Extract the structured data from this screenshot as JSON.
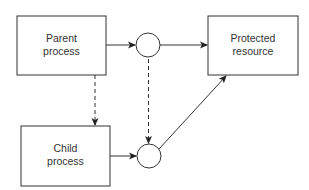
{
  "diagram": {
    "nodes": {
      "parent": {
        "line1": "Parent",
        "line2": "process"
      },
      "child": {
        "line1": "Child",
        "line2": "process"
      },
      "resource": {
        "line1": "Protected",
        "line2": "resource"
      }
    },
    "connectors": [
      {
        "from": "parent",
        "to": "circle-top",
        "style": "solid"
      },
      {
        "from": "circle-top",
        "to": "resource",
        "style": "solid"
      },
      {
        "from": "parent",
        "to": "child",
        "style": "dashed"
      },
      {
        "from": "circle-top",
        "to": "circle-bottom",
        "style": "dashed"
      },
      {
        "from": "child",
        "to": "circle-bottom",
        "style": "solid"
      },
      {
        "from": "circle-bottom",
        "to": "resource",
        "style": "solid"
      }
    ],
    "colors": {
      "stroke": "#333333",
      "fill": "#ffffff",
      "text": "#333333"
    }
  }
}
